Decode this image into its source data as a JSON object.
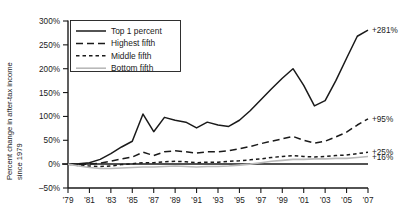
{
  "chart_data": {
    "type": "line",
    "title": "",
    "xlabel": "",
    "ylabel": "Percent change in after-tax income since 1979",
    "ylabel_line1": "Percent change in after-tax income",
    "ylabel_line2": "since 1979",
    "ylim": [
      -50,
      300
    ],
    "xlim": [
      1979,
      2007
    ],
    "grid": false,
    "legend_position": "top-left",
    "ytick_labels": [
      "300%",
      "250%",
      "200%",
      "150%",
      "100%",
      "50%",
      "0%",
      "–50%"
    ],
    "ytick_values": [
      300,
      250,
      200,
      150,
      100,
      50,
      0,
      -50
    ],
    "xtick_labels": [
      "’79",
      "’81",
      "’83",
      "’85",
      "’87",
      "’89",
      "’91",
      "’93",
      "’95",
      "’97",
      "’99",
      "’01",
      "’03",
      "’05",
      "’07"
    ],
    "xtick_values": [
      1979,
      1981,
      1983,
      1985,
      1987,
      1989,
      1991,
      1993,
      1995,
      1997,
      1999,
      2001,
      2003,
      2005,
      2007
    ],
    "x": [
      1979,
      1980,
      1981,
      1982,
      1983,
      1984,
      1985,
      1986,
      1987,
      1988,
      1989,
      1990,
      1991,
      1992,
      1993,
      1994,
      1995,
      1996,
      1997,
      1998,
      1999,
      2000,
      2001,
      2002,
      2003,
      2004,
      2005,
      2006,
      2007
    ],
    "series": [
      {
        "name": "Top 1 percent",
        "end_label": "+281%",
        "color": "#1a1a1a",
        "dash": "none",
        "width": 1.5,
        "values": [
          0,
          1,
          3,
          10,
          22,
          36,
          48,
          105,
          68,
          98,
          92,
          88,
          76,
          88,
          82,
          79,
          92,
          112,
          135,
          158,
          180,
          200,
          165,
          122,
          133,
          175,
          222,
          268,
          281
        ]
      },
      {
        "name": "Highest fifth",
        "end_label": "+95%",
        "color": "#1a1a1a",
        "dash": "7,4",
        "width": 1.5,
        "values": [
          0,
          -1,
          0,
          2,
          6,
          11,
          15,
          25,
          18,
          26,
          28,
          26,
          23,
          26,
          26,
          28,
          32,
          37,
          43,
          48,
          53,
          58,
          50,
          44,
          48,
          57,
          67,
          82,
          95
        ]
      },
      {
        "name": "Middle fifth",
        "end_label": "+25%",
        "color": "#1a1a1a",
        "dash": "3.5,3",
        "width": 1.5,
        "values": [
          0,
          -3,
          -4,
          -5,
          -4,
          -1,
          1,
          3,
          3,
          5,
          6,
          5,
          3,
          4,
          4,
          6,
          7,
          9,
          11,
          14,
          16,
          18,
          16,
          15,
          16,
          18,
          19,
          22,
          25
        ]
      },
      {
        "name": "Bottom fifth",
        "end_label": "+16%",
        "color": "#b9b9b9",
        "dash": "none",
        "width": 1.6,
        "values": [
          0,
          -4,
          -7,
          -9,
          -9,
          -8,
          -7,
          -6,
          -6,
          -5,
          -4,
          -5,
          -6,
          -5,
          -5,
          -4,
          -2,
          0,
          3,
          6,
          8,
          10,
          10,
          11,
          11,
          12,
          12,
          14,
          16
        ]
      }
    ]
  }
}
